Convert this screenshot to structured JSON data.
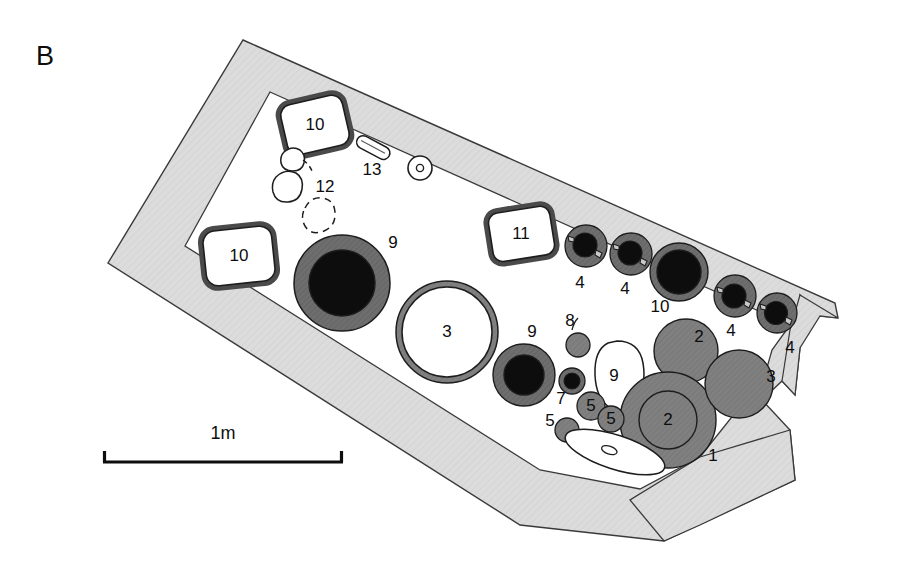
{
  "figure": {
    "panel_letter": "B",
    "type": "archaeological-site-plan",
    "background_color": "#ffffff"
  },
  "palette": {
    "band_fill": "#dcdcdc",
    "band_stroke": "#3a3a3a",
    "mid_gray": "#808080",
    "dark_gray": "#6e6e6e",
    "black": "#0d0d0d",
    "white": "#ffffff",
    "outline": "#2b2b2b"
  },
  "scale_bar": {
    "label": "1m",
    "x_start": 103,
    "x_end": 343,
    "y": 462,
    "label_x": 223,
    "label_y": 434
  },
  "features": [
    {
      "id": "f1",
      "label": "1",
      "kind": "gray-ring-circle",
      "cx": 668,
      "cy": 420,
      "r": 48,
      "inner_r": 29,
      "label_x": 712,
      "label_y": 456
    },
    {
      "id": "f2a",
      "label": "2",
      "kind": "gray-disc",
      "cx": 668,
      "cy": 420,
      "r": 29,
      "label_x": 668,
      "label_y": 420
    },
    {
      "id": "f2b",
      "label": "2",
      "kind": "gray-disc",
      "cx": 686,
      "cy": 351,
      "r": 32,
      "label_x": 697,
      "label_y": 338
    },
    {
      "id": "f3a",
      "label": "3",
      "kind": "white-ring-circle",
      "cx": 447,
      "cy": 332,
      "r": 51,
      "label_x": 447,
      "label_y": 332
    },
    {
      "id": "f3b",
      "label": "3",
      "kind": "gray-disc",
      "cx": 739,
      "cy": 384,
      "r": 34,
      "label_x": 770,
      "label_y": 377
    },
    {
      "id": "f4a",
      "label": "4",
      "kind": "posthole",
      "cx": 586,
      "cy": 246,
      "r": 21,
      "label_x": 580,
      "label_y": 283
    },
    {
      "id": "f4b",
      "label": "4",
      "kind": "posthole",
      "cx": 631,
      "cy": 254,
      "r": 21,
      "label_x": 625,
      "label_y": 289
    },
    {
      "id": "f4c",
      "label": "4",
      "kind": "posthole",
      "cx": 735,
      "cy": 296,
      "r": 21,
      "label_x": 731,
      "label_y": 331
    },
    {
      "id": "f4d",
      "label": "4",
      "kind": "posthole",
      "cx": 777,
      "cy": 313,
      "r": 20,
      "label_x": 790,
      "label_y": 348
    },
    {
      "id": "f5a",
      "label": "5",
      "kind": "gray-disc-labeled",
      "cx": 591,
      "cy": 406,
      "r": 14,
      "label_x": 591,
      "label_y": 406
    },
    {
      "id": "f5b",
      "label": "5",
      "kind": "gray-disc-labeled",
      "cx": 611,
      "cy": 419,
      "r": 13,
      "label_x": 611,
      "label_y": 419
    },
    {
      "id": "f5c",
      "label": "5",
      "kind": "gray-disc",
      "cx": 567,
      "cy": 430,
      "r": 12,
      "label_x": 551,
      "label_y": 421
    },
    {
      "id": "f6",
      "label": "6",
      "kind": "dark-small-ring",
      "cx": 572,
      "cy": 381,
      "r": 12,
      "label_x": 562,
      "label_y": 399
    },
    {
      "id": "f7",
      "label": "7",
      "kind": "gray-disc",
      "cx": 578,
      "cy": 345,
      "r": 12,
      "label_x": 570,
      "label_y": 321
    },
    {
      "id": "f8",
      "label": "8",
      "kind": "white-blob",
      "cx": 617,
      "cy": 377,
      "rx": 27,
      "ry": 36,
      "label_x": 614,
      "label_y": 376
    },
    {
      "id": "f9a",
      "label": "9",
      "kind": "black-ring-hearth",
      "cx": 342,
      "cy": 283,
      "r": 48,
      "inner_r": 32,
      "label_x": 393,
      "label_y": 243
    },
    {
      "id": "f9b",
      "label": "9",
      "kind": "black-ring-hearth",
      "cx": 524,
      "cy": 375,
      "r": 30,
      "inner_r": 20,
      "label_x": 532,
      "label_y": 332
    },
    {
      "id": "f9c",
      "label": "9",
      "kind": "black-ring-hearth",
      "cx": 679,
      "cy": 272,
      "r": 29,
      "inner_r": 22,
      "label_x": 660,
      "label_y": 307
    },
    {
      "id": "f10a",
      "label": "10",
      "kind": "stone-box",
      "cx": 315,
      "cy": 125,
      "w": 66,
      "h": 54,
      "rot": -13,
      "label_x": 315,
      "label_y": 125
    },
    {
      "id": "f10b",
      "label": "10",
      "kind": "stone-box",
      "cx": 239,
      "cy": 256,
      "w": 72,
      "h": 58,
      "rot": -6,
      "label_x": 239,
      "label_y": 256
    },
    {
      "id": "f10c",
      "label": "10",
      "kind": "stone-box",
      "cx": 521,
      "cy": 234,
      "w": 66,
      "h": 52,
      "rot": -9,
      "label_x": 521,
      "label_y": 234
    },
    {
      "id": "f11",
      "label": "11",
      "kind": "stone-cluster",
      "label_x": 325,
      "label_y": 187
    },
    {
      "id": "f12",
      "label": "12",
      "kind": "elongated-blade",
      "label_x": 372,
      "label_y": 170
    },
    {
      "id": "f13",
      "label": "13",
      "kind": "ring-with-dot",
      "cx": 420,
      "cy": 168,
      "r": 12,
      "label_x": 428,
      "label_y": 198
    }
  ],
  "label_list": [
    "1",
    "2",
    "3",
    "4",
    "5",
    "6",
    "7",
    "8",
    "9",
    "10",
    "11",
    "12",
    "13"
  ]
}
